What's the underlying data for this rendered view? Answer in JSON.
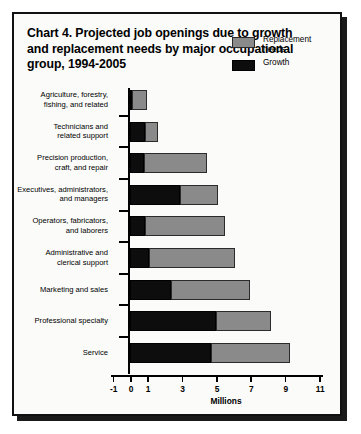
{
  "chart_data": {
    "type": "bar",
    "orientation": "horizontal",
    "stacked": true,
    "title": "Chart 4. Projected job openings due to growth and replacement needs by major occupational group, 1994-2005",
    "xlabel": "Millions",
    "ylabel": "",
    "xlim": [
      -1,
      11
    ],
    "xticks": [
      -1,
      0,
      1,
      3,
      5,
      7,
      9,
      11
    ],
    "xtick_labels": [
      "-1",
      "0",
      "1",
      "3",
      "5",
      "7",
      "9",
      "11"
    ],
    "grid": false,
    "legend_position": "top-right",
    "categories": [
      "Agriculture, forestry, fishing, and related",
      "Technicians and related support",
      "Precision production, craft, and repair",
      "Executives, administrators, and managers",
      "Operators, fabricators, and laborers",
      "Administrative and clerical support",
      "Marketing and sales",
      "Professional specialty",
      "Service"
    ],
    "series": [
      {
        "name": "Growth",
        "color": "#0d0d0d",
        "values": [
          0.1,
          0.85,
          0.8,
          2.9,
          0.9,
          1.1,
          2.4,
          5.0,
          4.7
        ]
      },
      {
        "name": "Replacement needs",
        "color": "#8a8a8a",
        "values": [
          0.9,
          0.75,
          3.7,
          2.2,
          4.6,
          5.0,
          4.6,
          3.2,
          4.6
        ]
      }
    ],
    "totals": [
      1.0,
      1.6,
      4.5,
      5.1,
      5.5,
      6.1,
      7.0,
      8.2,
      9.3
    ]
  },
  "chart": {
    "title_lines": [
      "Chart 4. Projected job openings due to growth",
      "and replacement needs by major occupational",
      "group, 1994-2005"
    ],
    "axis_title": "Millions",
    "legend": [
      {
        "label_line1": "Replacement",
        "label_line2": "needs",
        "swatch": "replacement"
      },
      {
        "label_line1": "Growth",
        "label_line2": "",
        "swatch": "growth"
      }
    ],
    "categories": [
      {
        "line1": "Agriculture, forestry,",
        "line2": "fishing, and related"
      },
      {
        "line1": "Technicians and",
        "line2": "related support"
      },
      {
        "line1": "Precision production,",
        "line2": "craft, and repair"
      },
      {
        "line1": "Executives, administrators,",
        "line2": "and managers"
      },
      {
        "line1": "Operators, fabricators,",
        "line2": "and laborers"
      },
      {
        "line1": "Administrative and",
        "line2": "clerical support"
      },
      {
        "line1": "Marketing and sales",
        "line2": ""
      },
      {
        "line1": "Professional specialty",
        "line2": ""
      },
      {
        "line1": "Service",
        "line2": ""
      }
    ],
    "colors": {
      "growth": "#0d0d0d",
      "replacement": "#8a8a8a",
      "card_background": "#fbfbf9",
      "frame": "#111111"
    }
  }
}
